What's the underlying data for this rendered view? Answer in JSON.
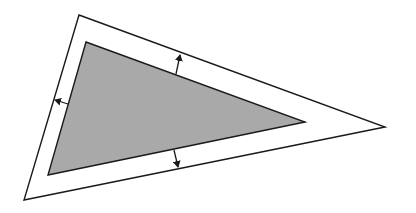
{
  "diagram": {
    "colors": {
      "background": "#ffffff",
      "inner_fill": "#a9a9a9",
      "stroke": "#1a1a1a"
    },
    "outer_triangle": {
      "label": "Offset (outer) triangle",
      "points": [
        [
          79,
          15
        ],
        [
          385,
          127
        ],
        [
          24,
          200
        ]
      ]
    },
    "inner_triangle": {
      "label": "Original (inner) shaded triangle",
      "points": [
        [
          86,
          42
        ],
        [
          305,
          122
        ],
        [
          48,
          175
        ]
      ]
    },
    "offset_arrows": [
      {
        "label": "Offset arrow top edge",
        "from": [
          176,
          74
        ],
        "to": [
          180,
          55
        ],
        "direction": "up"
      },
      {
        "label": "Offset arrow left edge",
        "from": [
          68,
          104
        ],
        "to": [
          55,
          100
        ],
        "direction": "left"
      },
      {
        "label": "Offset arrow bottom edge",
        "from": [
          174,
          150
        ],
        "to": [
          178,
          167
        ],
        "direction": "down"
      }
    ]
  }
}
